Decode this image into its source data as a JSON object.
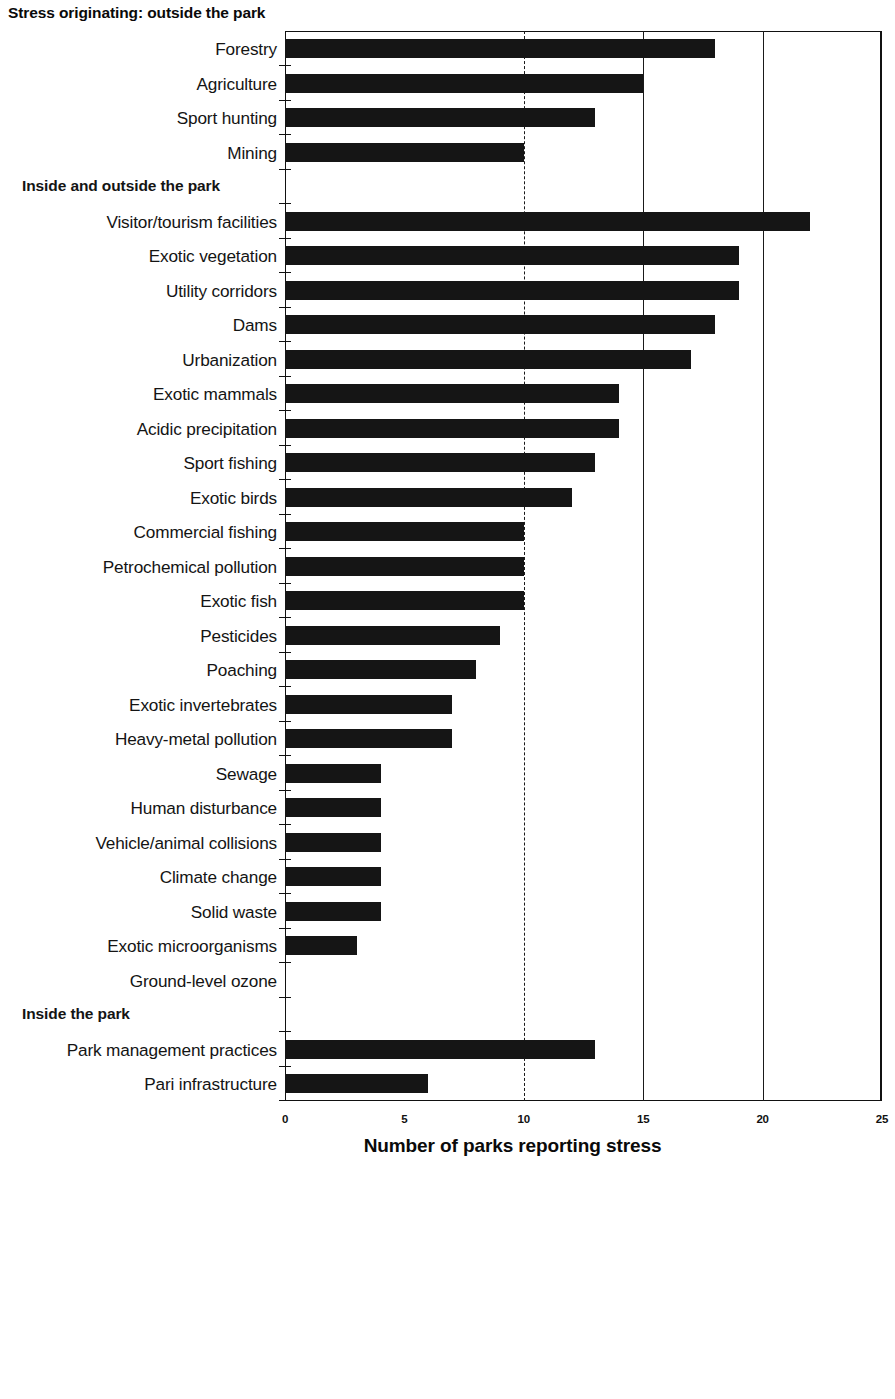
{
  "chart_data": {
    "type": "bar",
    "orientation": "horizontal",
    "title": "",
    "xlabel": "Number of parks reporting stress",
    "ylabel": "",
    "xlim": [
      0,
      25
    ],
    "xticks": [
      0,
      5,
      10,
      15,
      20,
      25
    ],
    "xtick_labels": [
      "0",
      "5",
      "10",
      "15",
      "20",
      "25"
    ],
    "grid": "vertical gridlines at 10 (dashed), 15 and 20 (solid)",
    "legend": "none",
    "categories": [
      "Forestry",
      "Agriculture",
      "Sport hunting",
      "Mining",
      "Visitor/tourism facilities",
      "Exotic vegetation",
      "Utility corridors",
      "Dams",
      "Urbanization",
      "Exotic mammals",
      "Acidic precipitation",
      "Sport fishing",
      "Exotic birds",
      "Commercial fishing",
      "Petrochemical pollution",
      "Exotic fish",
      "Pesticides",
      "Poaching",
      "Exotic invertebrates",
      "Heavy-metal pollution",
      "Sewage",
      "Human disturbance",
      "Vehicle/animal collisions",
      "Climate change",
      "Solid waste",
      "Exotic microorganisms",
      "Ground-level ozone",
      "Park management  practices",
      "Pari infrastructure"
    ],
    "values": [
      18,
      15,
      13,
      10,
      22,
      19,
      19,
      18,
      17,
      14,
      14,
      13,
      12,
      10,
      10,
      10,
      9,
      8,
      7,
      7,
      4,
      4,
      4,
      4,
      4,
      3,
      0,
      13,
      6
    ],
    "group_headers": [
      {
        "label": "Stress originating: outside the park",
        "before_category": "Forestry"
      },
      {
        "label": "Inside and outside the park",
        "before_category": "Visitor/tourism facilities"
      },
      {
        "label": "Inside the park",
        "before_category": "Park management  practices"
      }
    ],
    "bar_color": "#151515"
  },
  "rows": [
    {
      "kind": "group",
      "label": "Inside and outside the park"
    },
    {
      "kind": "bar",
      "label": "Forestry",
      "value": 18
    }
  ],
  "axis": {
    "x_title": "Number of parks reporting stress",
    "ticks": [
      {
        "value": 0,
        "label": "0"
      },
      {
        "value": 5,
        "label": "5"
      },
      {
        "value": 10,
        "label": "10"
      },
      {
        "value": 15,
        "label": "15"
      },
      {
        "value": 20,
        "label": "20"
      },
      {
        "value": 25,
        "label": "25"
      }
    ]
  },
  "headers": {
    "outside": "Stress originating: outside the park",
    "inside_outside": "Inside and outside the park",
    "inside": "Inside the park"
  }
}
